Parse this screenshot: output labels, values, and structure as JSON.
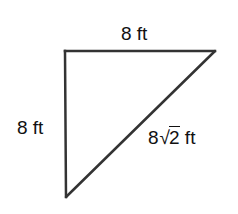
{
  "diagram": {
    "type": "right-triangle",
    "stroke_color": "#333333",
    "vertices": {
      "top_left": [
        65,
        51
      ],
      "top_right": [
        215,
        51
      ],
      "bottom": [
        66,
        197
      ]
    },
    "labels": {
      "top_side": "8 ft",
      "left_side": "8 ft",
      "hypotenuse": {
        "coefficient": "8",
        "radical": "√",
        "radicand": "2",
        "unit": " ft",
        "full": "8√2 ft"
      }
    }
  }
}
